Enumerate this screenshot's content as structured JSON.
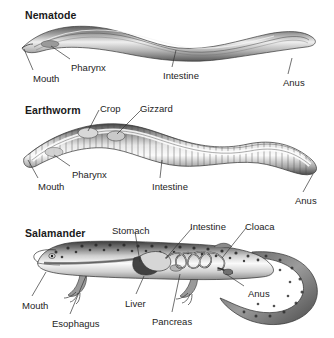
{
  "figure": {
    "background_color": "#ffffff",
    "text_color": "#242424",
    "heading_color": "#1a1a1a"
  },
  "panels": [
    {
      "id": "nematode",
      "heading": "Nematode",
      "organism_type": "roundworm",
      "labels": [
        {
          "text": "Mouth",
          "x": 33,
          "y": 74,
          "anchor_x": 24,
          "anchor_y": 49
        },
        {
          "text": "Pharynx",
          "x": 71,
          "y": 63,
          "anchor_x": 51,
          "anchor_y": 46
        },
        {
          "text": "Intestine",
          "x": 163,
          "y": 71,
          "anchor_x": 176,
          "anchor_y": 50
        },
        {
          "text": "Anus",
          "x": 283,
          "y": 78,
          "anchor_x": 292,
          "anchor_y": 58
        }
      ]
    },
    {
      "id": "earthworm",
      "heading": "Earthworm",
      "organism_type": "annelid",
      "labels": [
        {
          "text": "Crop",
          "x": 100,
          "y": 104,
          "anchor_x": 88,
          "anchor_y": 131
        },
        {
          "text": "Gizzard",
          "x": 140,
          "y": 104,
          "anchor_x": 117,
          "anchor_y": 134
        },
        {
          "text": "Pharynx",
          "x": 72,
          "y": 170,
          "anchor_x": 54,
          "anchor_y": 155
        },
        {
          "text": "Mouth",
          "x": 38,
          "y": 182,
          "anchor_x": 28,
          "anchor_y": 160
        },
        {
          "text": "Intestine",
          "x": 152,
          "y": 182,
          "anchor_x": 162,
          "anchor_y": 160
        },
        {
          "text": "Anus",
          "x": 295,
          "y": 196,
          "anchor_x": 313,
          "anchor_y": 174
        }
      ]
    },
    {
      "id": "salamander",
      "heading": "Salamander",
      "organism_type": "amphibian",
      "labels": [
        {
          "text": "Stomach",
          "x": 112,
          "y": 226,
          "anchor_x": 140,
          "anchor_y": 262
        },
        {
          "text": "Intestine",
          "x": 190,
          "y": 222,
          "anchor_x": 166,
          "anchor_y": 258
        },
        {
          "text": "Cloaca",
          "x": 245,
          "y": 222,
          "anchor_x": 222,
          "anchor_y": 258
        },
        {
          "text": "Mouth",
          "x": 22,
          "y": 301,
          "anchor_x": 46,
          "anchor_y": 272
        },
        {
          "text": "Esophagus",
          "x": 52,
          "y": 319,
          "anchor_x": 86,
          "anchor_y": 276
        },
        {
          "text": "Liver",
          "x": 125,
          "y": 299,
          "anchor_x": 144,
          "anchor_y": 276
        },
        {
          "text": "Pancreas",
          "x": 152,
          "y": 317,
          "anchor_x": 180,
          "anchor_y": 274
        },
        {
          "text": "Anus",
          "x": 248,
          "y": 289,
          "anchor_x": 226,
          "anchor_y": 274
        }
      ]
    }
  ]
}
